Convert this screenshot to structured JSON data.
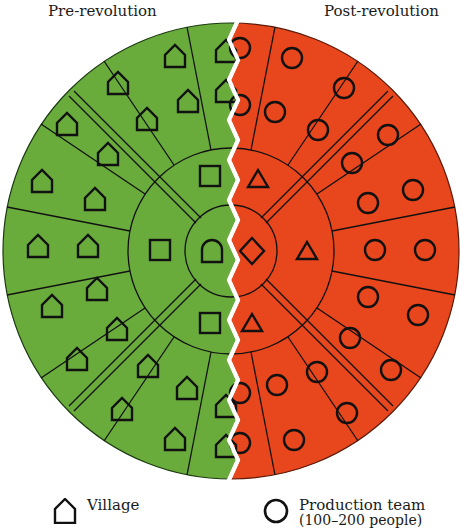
{
  "titles": {
    "left": "Pre-revolution",
    "right": "Post-revolution"
  },
  "colors": {
    "pre_fill": "#6aac3c",
    "post_fill": "#e8461c",
    "outline": "#111111",
    "divider": "#ffffff",
    "background": "#ffffff"
  },
  "geometry": {
    "center": [
      231,
      251
    ],
    "outer_radius": 228,
    "middle_radius": 103,
    "inner_radius": 46,
    "sector_count": 16
  },
  "legend": [
    {
      "icon": "house-icon",
      "label": "Village",
      "sublabel": ""
    },
    {
      "icon": "circle-icon",
      "label": "Production team",
      "sublabel": "(100–200 people)"
    }
  ],
  "left_half": {
    "outer_ring_icon": "house-icon",
    "middle_ring_icon": "square-icon",
    "inner_icon": "arch-icon"
  },
  "right_half": {
    "outer_ring_icon": "circle-icon",
    "middle_ring_icon": "triangle-icon",
    "inner_icon": "diamond-icon"
  }
}
